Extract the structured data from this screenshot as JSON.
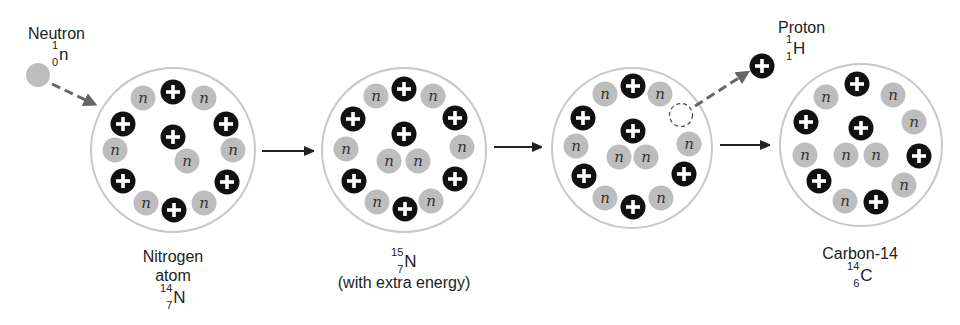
{
  "colors": {
    "proton": "#111111",
    "neutron": "#bdbdbd",
    "nucleus_border": "#c8c8c8",
    "arrow": "#333333",
    "dashed_arrow": "#666666"
  },
  "particle_symbols": {
    "proton": "+",
    "neutron": "n"
  },
  "incoming": {
    "name": "Neutron",
    "symbol": "n",
    "mass": "1",
    "atomic": "0"
  },
  "outgoing": {
    "name": "Proton",
    "symbol": "H",
    "mass": "1",
    "atomic": "1"
  },
  "stages": [
    {
      "id": "nitrogen-14",
      "caption_lines": [
        "Nitrogen",
        "atom"
      ],
      "isotope": {
        "symbol": "N",
        "mass": "14",
        "atomic": "7"
      },
      "protons": 7,
      "neutrons": 7
    },
    {
      "id": "nitrogen-15",
      "caption_lines": [
        "(with extra energy)"
      ],
      "isotope": {
        "symbol": "N",
        "mass": "15",
        "atomic": "7"
      },
      "protons": 7,
      "neutrons": 8
    },
    {
      "id": "ejection",
      "caption_lines": [],
      "protons": 6,
      "neutrons": 8,
      "note": "proton leaving (dashed empty site)"
    },
    {
      "id": "carbon-14",
      "caption_lines": [
        "Carbon-14"
      ],
      "isotope": {
        "symbol": "C",
        "mass": "14",
        "atomic": "6"
      },
      "protons": 6,
      "neutrons": 8
    }
  ]
}
